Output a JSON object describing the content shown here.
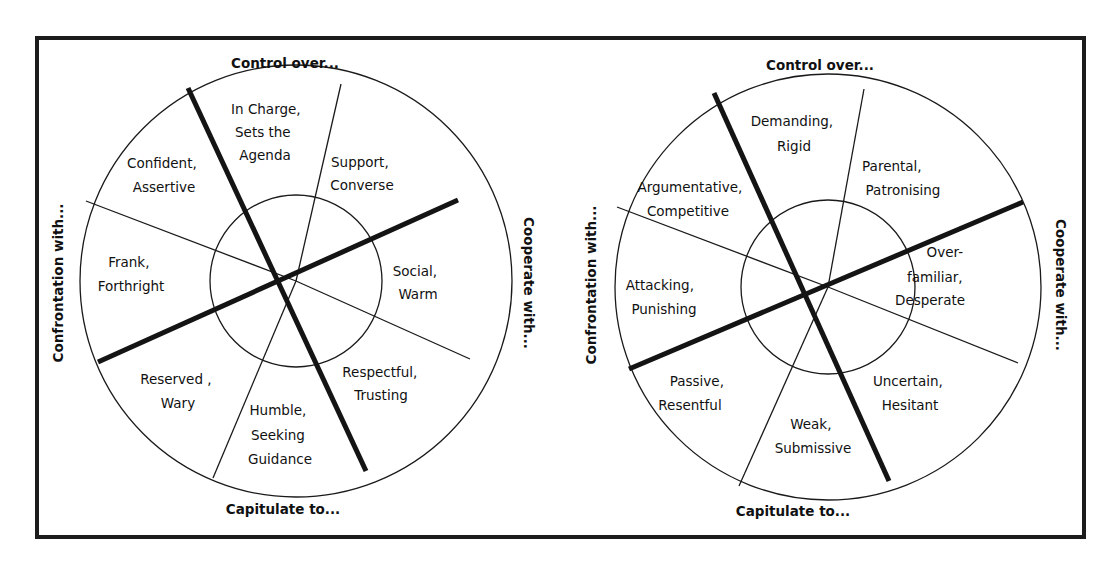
{
  "diagram": {
    "left": {
      "axes": {
        "top": "Control over...",
        "bottom": "Capitulate to...",
        "left": "Confrontation with...",
        "right": "Cooperate with..."
      },
      "segments": [
        {
          "lines": [
            "In Charge,",
            "Sets the",
            "Agenda"
          ]
        },
        {
          "lines": [
            "Support,",
            "Converse"
          ]
        },
        {
          "lines": [
            "Social,",
            "Warm"
          ]
        },
        {
          "lines": [
            "Respectful,",
            "Trusting"
          ]
        },
        {
          "lines": [
            "Humble,",
            "Seeking",
            "Guidance"
          ]
        },
        {
          "lines": [
            "Reserved ,",
            "Wary"
          ]
        },
        {
          "lines": [
            "Frank,",
            "Forthright"
          ]
        },
        {
          "lines": [
            "Confident,",
            "Assertive"
          ]
        }
      ]
    },
    "right": {
      "axes": {
        "top": "Control over...",
        "bottom": "Capitulate to...",
        "left": "Confrontation with...",
        "right": "Cooperate with..."
      },
      "segments": [
        {
          "lines": [
            "Demanding,",
            "Rigid"
          ]
        },
        {
          "lines": [
            "Parental,",
            "Patronising"
          ]
        },
        {
          "lines": [
            "Over-",
            "familiar,",
            "Desperate"
          ]
        },
        {
          "lines": [
            "Uncertain,",
            "Hesitant"
          ]
        },
        {
          "lines": [
            "Weak,",
            "Submissive"
          ]
        },
        {
          "lines": [
            "Passive,",
            "Resentful"
          ]
        },
        {
          "lines": [
            "Attacking,",
            "Punishing"
          ]
        },
        {
          "lines": [
            "Argumentative,",
            "Competitive"
          ]
        }
      ]
    }
  }
}
